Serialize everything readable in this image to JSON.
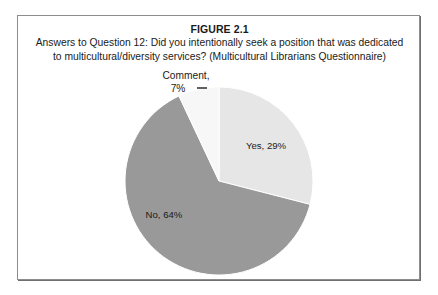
{
  "figure": {
    "title": "FIGURE 2.1",
    "caption_line_1": "Answers to Question 12: Did you intentionally seek a position that was dedicated",
    "caption_line_2": "to multicultural/diversity services? (Multicultural Librarians Questionnaire)"
  },
  "labels": {
    "comment_name": "Comment,",
    "comment_value": "7%",
    "yes_label": "Yes, 29%",
    "no_label": "No, 64%"
  },
  "chart_data": {
    "type": "pie",
    "title": "FIGURE 2.1",
    "subtitle": "Answers to Question 12: Did you intentionally seek a position that was dedicated to multicultural/diversity services? (Multicultural Librarians Questionnaire)",
    "categories": [
      "Yes",
      "No",
      "Comment"
    ],
    "values": [
      29,
      64,
      7
    ],
    "units": "percent",
    "labels": [
      "Yes, 29%",
      "No, 64%",
      "Comment, 7%"
    ],
    "colors": [
      "#e6e6e6",
      "#999999",
      "#f7f7f7"
    ],
    "slice_border_color": "#ffffff",
    "start_angle_deg": 0,
    "direction": "clockwise",
    "legend": "none",
    "data_labels": "inside for Yes and No, outside with leader line for Comment",
    "grid": false
  },
  "style": {
    "frame_border": "#8d8d8d",
    "page_background": "#ffffff",
    "text_color": "#1a1a1a",
    "leader_line_color": "#3a3a3a"
  }
}
